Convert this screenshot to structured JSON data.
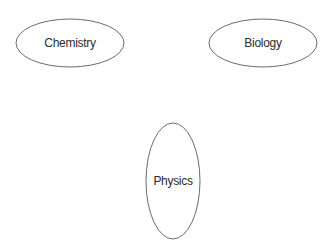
{
  "diagram": {
    "type": "ellipse-nodes",
    "background": "#ffffff",
    "stroke_color": "#6b6b6b",
    "text_color": "#2b2b2b",
    "nodes": [
      {
        "label": "Chemistry",
        "cx": 70,
        "cy": 43,
        "rx": 54,
        "ry": 24
      },
      {
        "label": "Biology",
        "cx": 263,
        "cy": 43,
        "rx": 54,
        "ry": 24
      },
      {
        "label": "Physics",
        "cx": 173,
        "cy": 181,
        "rx": 27,
        "ry": 58
      }
    ],
    "edges": []
  }
}
